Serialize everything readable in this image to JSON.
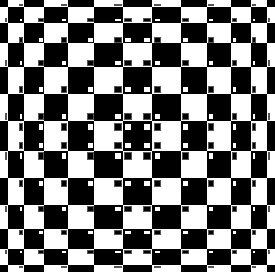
{
  "illusion": {
    "title": "Bulging checkerboard illusion",
    "colors": {
      "dark": "#000000",
      "light": "#ffffff"
    },
    "columns": [
      7,
      14,
      18,
      21,
      23,
      25,
      26,
      25,
      23,
      21,
      18,
      14,
      7
    ],
    "rows": [
      6,
      14,
      18,
      21,
      23,
      24,
      26,
      24,
      23,
      21,
      18,
      14,
      6
    ],
    "center_index": 6,
    "center_color": "dark",
    "dot_ratio": 0.26
  }
}
